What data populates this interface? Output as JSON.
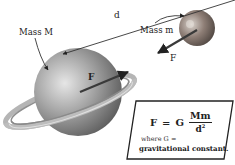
{
  "diagram": {
    "labels": {
      "mass_large": "Mass M",
      "mass_small": "Mass m",
      "distance": "d",
      "force_on_large": "F",
      "force_on_small": "F"
    },
    "formula": {
      "lhs": "F",
      "equals": "=",
      "constant": "G",
      "numerator": "Mm",
      "denominator": "d",
      "exponent": "2",
      "where_text": "where G =",
      "constant_desc": "gravitational constant."
    },
    "colors": {
      "planet_large": "#9a9a9a",
      "planet_small": "#8a7a72",
      "ring": "#b8b8b8",
      "line": "#333333",
      "box_border": "#222222"
    }
  }
}
